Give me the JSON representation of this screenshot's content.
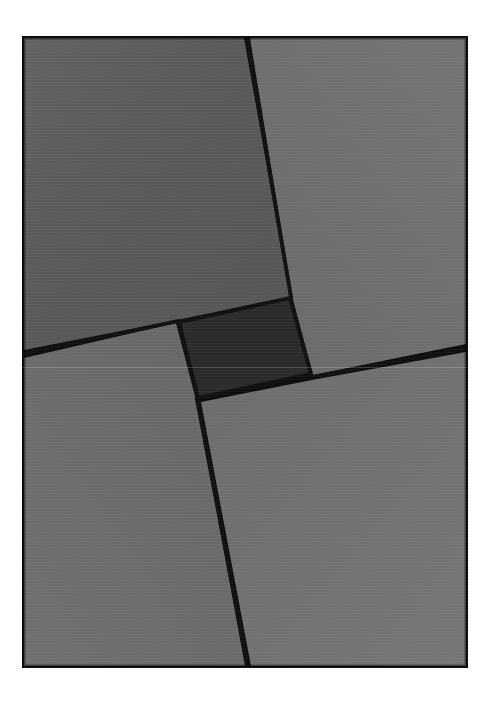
{
  "page": {
    "background_color": "#ffffff",
    "width": 492,
    "height": 702
  },
  "top_bar": {
    "name": "top-gray-bar",
    "color": "#a9a9a9",
    "height_px": 7,
    "label": ""
  },
  "figure": {
    "caption": "",
    "frame": {
      "label": "",
      "border_color": "#0d0d0d",
      "border_width_px": 4,
      "x": 22,
      "y": 36,
      "width": 446,
      "height": 632
    },
    "divider_color": "#111111",
    "divider_width_px": 4,
    "regions": [
      {
        "id": "region-top-left",
        "label": "",
        "color": "#5b5b5b",
        "points": "24,38 244,38 290,297 177,320 24,350"
      },
      {
        "id": "region-top-right",
        "label": "",
        "color": "#6f6f6f",
        "points": "250,38 466,38 466,344 313,375 292,296"
      },
      {
        "id": "region-bottom-left",
        "label": "",
        "color": "#6b6b6b",
        "points": "24,358 176,323 196,400 245,666 24,666"
      },
      {
        "id": "region-bottom-right",
        "label": "",
        "color": "#717171",
        "points": "201,402 312,380 466,352 466,666 251,666"
      },
      {
        "id": "region-center-square",
        "label": "",
        "color": "#2b2b2b",
        "points": "179,322 290,298 311,374 198,398"
      }
    ],
    "dividers": [
      {
        "id": "divider-top",
        "label": "",
        "x1": 247,
        "y1": 37,
        "x2": 291,
        "y2": 297
      },
      {
        "id": "divider-left",
        "label": "",
        "x1": 23,
        "y1": 354,
        "x2": 178,
        "y2": 321
      },
      {
        "id": "divider-right",
        "label": "",
        "x1": 467,
        "y1": 348,
        "x2": 312,
        "y2": 377
      },
      {
        "id": "divider-bottom",
        "label": "",
        "x1": 248,
        "y1": 667,
        "x2": 197,
        "y2": 399
      }
    ]
  }
}
